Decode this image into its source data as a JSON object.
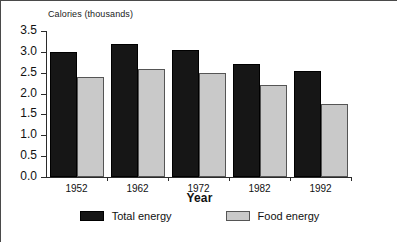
{
  "chart_data": {
    "type": "bar",
    "title": "Calories (thousands)",
    "xlabel": "Year",
    "ylabel": "",
    "categories": [
      "1952",
      "1962",
      "1972",
      "1982",
      "1992"
    ],
    "series": [
      {
        "name": "Total energy",
        "color": "#161616",
        "values": [
          3.0,
          3.2,
          3.05,
          2.7,
          2.55
        ]
      },
      {
        "name": "Food energy",
        "color": "#c9c9c9",
        "values": [
          2.4,
          2.6,
          2.5,
          2.2,
          1.75
        ]
      }
    ],
    "ylim": [
      0.0,
      3.5
    ],
    "ytick_labels": [
      "3.5",
      "3.0",
      "2.5",
      "2.0",
      "1.5",
      "1.0",
      "0.5",
      "0.0"
    ],
    "ytick_values": [
      3.5,
      3.0,
      2.5,
      2.0,
      1.5,
      1.0,
      0.5,
      0.0
    ],
    "grid": false,
    "legend_position": "bottom"
  },
  "legend": {
    "items": [
      {
        "label": "Total energy"
      },
      {
        "label": "Food energy"
      }
    ]
  }
}
